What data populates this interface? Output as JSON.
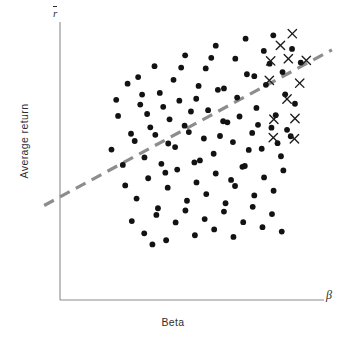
{
  "chart_data": {
    "type": "scatter",
    "title": "",
    "xlabel": "Beta",
    "ylabel": "Average return",
    "x_axis_symbol": "β",
    "y_axis_symbol": "r",
    "y_axis_symbol_note": "r with overbar (mean return)",
    "grid": false,
    "legend": "none",
    "xlim": [
      0,
      100
    ],
    "ylim": [
      0,
      100
    ],
    "axis_ticks": [],
    "annotations": [],
    "series": [
      {
        "name": "Securities",
        "marker": "filled-circle",
        "color": "#121212",
        "count": 110,
        "points": [
          [
            25.6,
            77.8
          ],
          [
            31.1,
            73.9
          ],
          [
            35.8,
            84.1
          ],
          [
            39.1,
            69.5
          ],
          [
            43.0,
            79.2
          ],
          [
            47.4,
            88.0
          ],
          [
            51.6,
            72.4
          ],
          [
            55.2,
            83.3
          ],
          [
            59.0,
            91.5
          ],
          [
            62.1,
            76.1
          ],
          [
            66.4,
            86.8
          ],
          [
            70.3,
            94.0
          ],
          [
            73.6,
            80.5
          ],
          [
            77.2,
            89.6
          ],
          [
            80.8,
            95.2
          ],
          [
            84.3,
            82.0
          ],
          [
            87.9,
            90.3
          ],
          [
            91.2,
            85.4
          ],
          [
            22.0,
            66.2
          ],
          [
            26.9,
            59.8
          ],
          [
            30.4,
            70.3
          ],
          [
            34.2,
            62.1
          ],
          [
            37.8,
            74.5
          ],
          [
            41.5,
            65.0
          ],
          [
            45.2,
            71.7
          ],
          [
            48.8,
            60.4
          ],
          [
            52.5,
            77.0
          ],
          [
            56.1,
            68.3
          ],
          [
            59.8,
            75.6
          ],
          [
            63.4,
            63.9
          ],
          [
            67.1,
            72.8
          ],
          [
            70.8,
            81.2
          ],
          [
            74.4,
            69.1
          ],
          [
            78.0,
            77.4
          ],
          [
            81.7,
            66.5
          ],
          [
            85.3,
            74.0
          ],
          [
            89.0,
            70.6
          ],
          [
            19.5,
            54.1
          ],
          [
            23.8,
            48.6
          ],
          [
            28.3,
            57.2
          ],
          [
            32.0,
            51.3
          ],
          [
            36.1,
            59.4
          ],
          [
            39.9,
            45.8
          ],
          [
            43.6,
            55.0
          ],
          [
            47.2,
            62.7
          ],
          [
            50.9,
            49.5
          ],
          [
            54.5,
            58.1
          ],
          [
            58.2,
            52.6
          ],
          [
            61.8,
            64.3
          ],
          [
            65.5,
            56.8
          ],
          [
            69.1,
            47.9
          ],
          [
            72.8,
            60.1
          ],
          [
            76.4,
            54.4
          ],
          [
            80.1,
            62.0
          ],
          [
            83.7,
            51.7
          ],
          [
            87.4,
            58.9
          ],
          [
            24.7,
            41.2
          ],
          [
            29.0,
            36.5
          ],
          [
            33.4,
            43.8
          ],
          [
            37.1,
            33.0
          ],
          [
            40.8,
            40.4
          ],
          [
            44.4,
            46.9
          ],
          [
            48.1,
            35.7
          ],
          [
            51.7,
            42.3
          ],
          [
            55.4,
            38.1
          ],
          [
            59.0,
            45.5
          ],
          [
            62.7,
            34.8
          ],
          [
            66.3,
            41.0
          ],
          [
            70.0,
            48.2
          ],
          [
            73.6,
            37.6
          ],
          [
            77.3,
            44.1
          ],
          [
            80.9,
            39.3
          ],
          [
            84.6,
            46.6
          ],
          [
            27.2,
            28.4
          ],
          [
            31.9,
            24.0
          ],
          [
            36.5,
            30.6
          ],
          [
            40.2,
            21.5
          ],
          [
            43.8,
            27.9
          ],
          [
            47.5,
            32.2
          ],
          [
            51.1,
            23.3
          ],
          [
            54.8,
            29.1
          ],
          [
            58.4,
            25.4
          ],
          [
            62.1,
            31.8
          ],
          [
            65.7,
            22.7
          ],
          [
            69.4,
            28.0
          ],
          [
            73.0,
            33.5
          ],
          [
            76.7,
            26.2
          ],
          [
            80.3,
            30.9
          ],
          [
            84.0,
            24.6
          ],
          [
            21.3,
            72.0
          ],
          [
            33.0,
            66.9
          ],
          [
            45.9,
            83.6
          ],
          [
            57.3,
            87.1
          ],
          [
            68.0,
            66.0
          ],
          [
            79.4,
            85.0
          ],
          [
            29.6,
            80.2
          ],
          [
            41.0,
            56.3
          ],
          [
            53.0,
            50.2
          ],
          [
            64.8,
            43.2
          ],
          [
            75.0,
            63.0
          ],
          [
            86.0,
            61.2
          ],
          [
            38.4,
            49.0
          ],
          [
            49.6,
            67.8
          ],
          [
            60.6,
            59.0
          ],
          [
            71.5,
            54.0
          ],
          [
            82.4,
            56.4
          ],
          [
            35.0,
            20.0
          ]
        ]
      },
      {
        "name": "Outlier securities",
        "marker": "cross",
        "color": "#1b1b1b",
        "count": 13,
        "points": [
          [
            88.0,
            95.8
          ],
          [
            83.5,
            91.6
          ],
          [
            79.8,
            86.0
          ],
          [
            86.5,
            86.8
          ],
          [
            93.3,
            86.2
          ],
          [
            79.3,
            79.0
          ],
          [
            90.8,
            78.0
          ],
          [
            86.0,
            72.3
          ],
          [
            81.0,
            65.0
          ],
          [
            89.0,
            65.3
          ],
          [
            80.8,
            58.4
          ],
          [
            88.8,
            58.0
          ]
        ]
      }
    ],
    "trendline": {
      "name": "Security market line (fitted)",
      "style": "dashed",
      "color": "#8d8d8d",
      "x_start": -6.0,
      "y_start": 34.0,
      "x_end": 103.0,
      "y_end": 90.0
    }
  },
  "axis": {
    "y_top_symbol": "r",
    "x_end_symbol": "β",
    "x_title": "Beta",
    "y_title": "Average return"
  },
  "colors": {
    "background": "#ffffff",
    "axis": "#8b8b8b",
    "dot": "#121212",
    "cross": "#1b1b1b",
    "trendline": "#8d8d8d",
    "text": "#2d2d2d"
  }
}
